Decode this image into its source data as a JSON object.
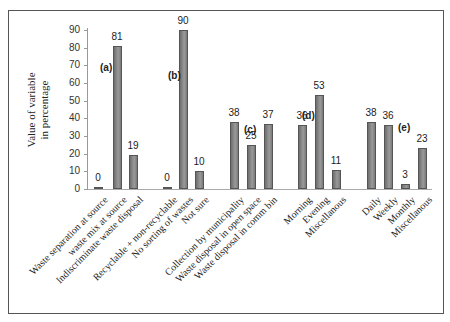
{
  "chart_data": {
    "type": "bar",
    "title": "",
    "xlabel": "",
    "ylabel": "Value of variable in percentage",
    "ylabel_lines": [
      "Value of variable",
      "in percentage"
    ],
    "ylim": [
      0,
      90
    ],
    "yticks": [
      0,
      10,
      20,
      30,
      40,
      50,
      60,
      70,
      80,
      90
    ],
    "grid": false,
    "legend": null,
    "groups": [
      {
        "label": "(a)",
        "categories": [
          "Waste separation at source",
          "waste mix at source",
          "Indiscriminate waste disposal"
        ],
        "values": [
          0,
          81,
          19
        ]
      },
      {
        "label": "(b)",
        "categories": [
          "Recyclable + non-recyclable",
          "No sorting of wastes",
          "Not sure"
        ],
        "values": [
          0,
          90,
          10
        ]
      },
      {
        "label": "(c)",
        "categories": [
          "Collection by municipality",
          "Waste disposal in open space",
          "Waste disposal in comm bin"
        ],
        "values": [
          38,
          25,
          37
        ]
      },
      {
        "label": "(d)",
        "categories": [
          "Morning",
          "Evening",
          "Miscellanous"
        ],
        "values": [
          36,
          53,
          11
        ]
      },
      {
        "label": "(e)",
        "categories": [
          "Daily",
          "Weekly",
          "Monthly",
          "Miscellanous"
        ],
        "values": [
          38,
          36,
          3,
          23
        ]
      }
    ],
    "categories": [
      "Waste separation at source",
      "waste mix at source",
      "Indiscriminate waste disposal",
      "Recyclable + non-recyclable",
      "No sorting of wastes",
      "Not sure",
      "Collection by municipality",
      "Waste disposal in open space",
      "Waste disposal in comm bin",
      "Morning",
      "Evening",
      "Miscellanous",
      "Daily",
      "Weekly",
      "Monthly",
      "Miscellanous"
    ],
    "values": [
      0,
      81,
      19,
      0,
      90,
      10,
      38,
      25,
      37,
      36,
      53,
      11,
      38,
      36,
      3,
      23
    ],
    "bar_color": "#808080"
  }
}
